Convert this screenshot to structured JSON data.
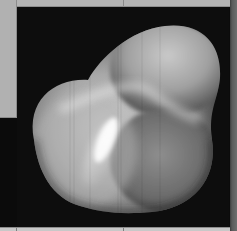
{
  "viewer": {
    "title": "3D surface viewport",
    "object": "rendered-blob-surface"
  },
  "colors": {
    "panel_gray": "#b4b4b4",
    "viewport_background": "#0d0d0d",
    "surface_highlight": "#f2f2f2",
    "surface_mid": "#9a9a9a",
    "surface_shadow": "#3e3e3e",
    "right_border": "#5a5a5a",
    "bottom_strip": "#c8c8c8"
  }
}
